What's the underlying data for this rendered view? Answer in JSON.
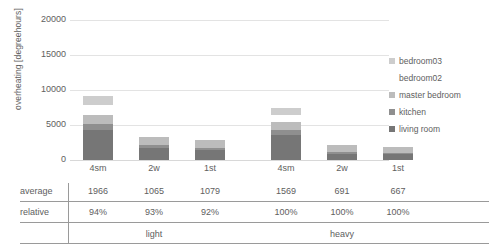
{
  "chart_data": {
    "type": "bar",
    "subtype": "stacked-bar",
    "title": "",
    "xlabel": "",
    "ylabel": "overheating [degreehours]",
    "ylim": [
      0,
      20000
    ],
    "yticks": [
      0,
      5000,
      10000,
      15000,
      20000
    ],
    "ytick_labels": [
      "0",
      "5000",
      "10000",
      "15000",
      "20000"
    ],
    "grid": true,
    "legend_position": "right",
    "categories": [
      "4sm",
      "2w",
      "1st",
      "4sm",
      "2w",
      "1st"
    ],
    "groups": [
      {
        "label": "light",
        "categories": [
          "4sm",
          "2w",
          "1st"
        ]
      },
      {
        "label": "heavy",
        "categories": [
          "4sm",
          "2w",
          "1st"
        ]
      }
    ],
    "series": [
      {
        "name": "living room",
        "color": "#767676",
        "values": [
          4300,
          1750,
          1500,
          3600,
          900,
          800
        ]
      },
      {
        "name": "kitchen",
        "color": "#8f8f8f",
        "values": [
          800,
          350,
          250,
          700,
          300,
          250
        ]
      },
      {
        "name": "master bedroom",
        "color": "#bcbcbc",
        "values": [
          1350,
          1250,
          1150,
          1150,
          1000,
          750
        ]
      },
      {
        "name": "bedroom02",
        "color": "#ffffff",
        "values": [
          1450,
          0,
          0,
          1050,
          0,
          0
        ]
      },
      {
        "name": "bedroom03",
        "color": "#cdcdcd",
        "values": [
          1200,
          0,
          0,
          1000,
          0,
          0
        ]
      }
    ]
  },
  "legend": {
    "entries": [
      {
        "label": "bedroom03",
        "color": "#cdcdcd"
      },
      {
        "label": "bedroom02",
        "color": "#ffffff"
      },
      {
        "label": "master bedroom",
        "color": "#bcbcbc"
      },
      {
        "label": "kitchen",
        "color": "#8f8f8f"
      },
      {
        "label": "living room",
        "color": "#767676"
      }
    ]
  },
  "table": {
    "row_labels": [
      "average",
      "relative"
    ],
    "column_headers": [
      "4sm",
      "2w",
      "1st",
      "4sm",
      "2w",
      "1st"
    ],
    "rows": [
      {
        "label": "average",
        "values": [
          "1966",
          "1065",
          "1079",
          "1569",
          "691",
          "667"
        ]
      },
      {
        "label": "relative",
        "values": [
          "94%",
          "93%",
          "92%",
          "100%",
          "100%",
          "100%"
        ]
      }
    ],
    "group_labels": [
      "light",
      "heavy"
    ]
  },
  "colors": {
    "text": "#5e5e5e",
    "gridline": "#e3e3e3",
    "rule": "#9a9a9a",
    "background": "#ffffff"
  }
}
